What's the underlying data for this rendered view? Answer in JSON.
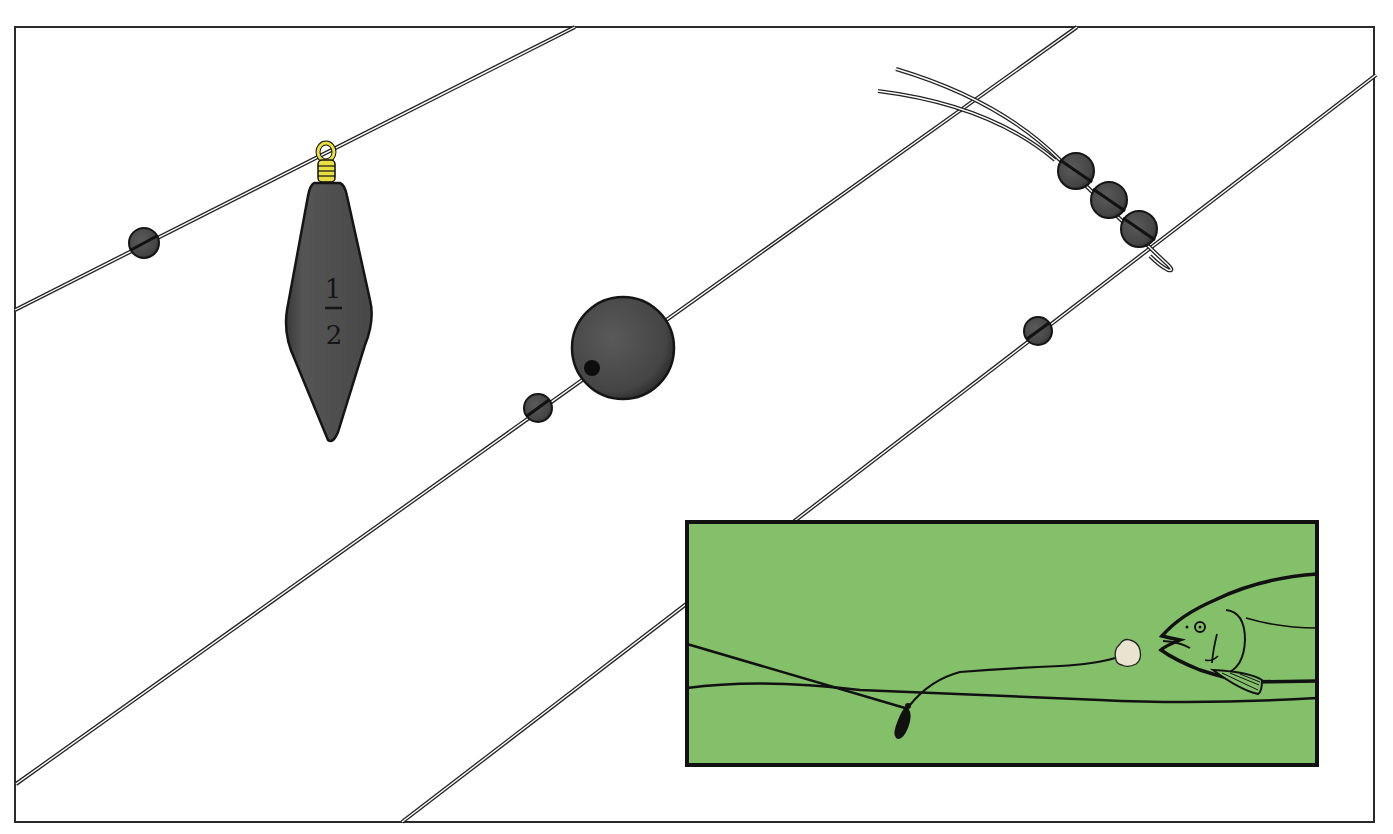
{
  "illustration": {
    "subject": "fishing rig components",
    "colors": {
      "background": "#ffffff",
      "frame": "#2a2a2a",
      "lead": "#4a4a4a",
      "lead_dark": "#1f1f1f",
      "brass_wire": "#e8e040",
      "water": "#84c06a",
      "ink": "#151515"
    },
    "sinker": {
      "weight_numerator": "1",
      "weight_denominator": "2",
      "label": "1/2"
    },
    "inset": {
      "description": "bottom rig with bait near fish"
    }
  }
}
